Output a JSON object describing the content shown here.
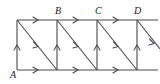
{
  "figure": {
    "kind": "lattice-path-diagram",
    "canvas": {
      "width": 160,
      "height": 84
    },
    "style": {
      "line_color": "#4a4a52",
      "label_color": "#1a1a1a",
      "background": "#ffffff",
      "stroke_width": 1.1
    },
    "geometry": {
      "left_x": 17,
      "top_y": 20,
      "mid_y": 45,
      "bottom_y": 70,
      "cell_width": 40,
      "column_x": [
        17,
        57,
        97,
        137
      ],
      "clip_right_x": 158
    },
    "labels": [
      {
        "id": "A",
        "text": "A",
        "x": 12,
        "y": 71,
        "anchor": "bottom-left-vertex"
      },
      {
        "id": "B",
        "text": "B",
        "x": 54,
        "y": 8,
        "anchor": "top-vertex-2"
      },
      {
        "id": "C",
        "text": "C",
        "x": 94,
        "y": 8,
        "anchor": "top-vertex-3"
      },
      {
        "id": "D",
        "text": "D",
        "x": 134,
        "y": 8,
        "anchor": "top-vertex-4"
      }
    ],
    "edges": {
      "horizontal_top": {
        "count": 3,
        "direction": "right",
        "segments": [
          {
            "from": [
              17,
              20
            ],
            "to": [
              57,
              20
            ]
          },
          {
            "from": [
              57,
              20
            ],
            "to": [
              97,
              20
            ]
          },
          {
            "from": [
              97,
              20
            ],
            "to": [
              137,
              20
            ]
          },
          {
            "from": [
              137,
              20
            ],
            "to": [
              158,
              20
            ]
          }
        ]
      },
      "horizontal_bottom": {
        "count": 3,
        "direction": "right",
        "segments": [
          {
            "from": [
              17,
              70
            ],
            "to": [
              57,
              70
            ]
          },
          {
            "from": [
              57,
              70
            ],
            "to": [
              97,
              70
            ]
          },
          {
            "from": [
              97,
              70
            ],
            "to": [
              137,
              70
            ]
          },
          {
            "from": [
              137,
              70
            ],
            "to": [
              158,
              70
            ]
          }
        ]
      },
      "vertical": {
        "count": 4,
        "direction": "up",
        "segments": [
          {
            "from": [
              17,
              70
            ],
            "to": [
              17,
              20
            ]
          },
          {
            "from": [
              57,
              70
            ],
            "to": [
              57,
              20
            ]
          },
          {
            "from": [
              97,
              70
            ],
            "to": [
              97,
              20
            ]
          },
          {
            "from": [
              137,
              70
            ],
            "to": [
              137,
              20
            ]
          }
        ]
      },
      "diagonal": {
        "count": 4,
        "direction": "down-right",
        "segments": [
          {
            "from": [
              17,
              20
            ],
            "to": [
              57,
              70
            ]
          },
          {
            "from": [
              57,
              20
            ],
            "to": [
              97,
              70
            ]
          },
          {
            "from": [
              97,
              20
            ],
            "to": [
              137,
              70
            ]
          },
          {
            "from": [
              137,
              20
            ],
            "to": [
              158,
              46
            ]
          }
        ]
      }
    },
    "arrow_markers": {
      "top_row_y": 20,
      "bottom_row_y": 70,
      "mid_row_y": 45,
      "note": "arrowheads at midpoint of each edge"
    }
  }
}
